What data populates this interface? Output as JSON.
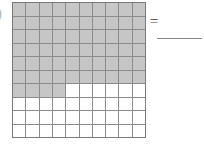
{
  "worksheet": {
    "item_label": ")",
    "equals_sign": "=",
    "answer_value": "",
    "answer_placeholder": ""
  },
  "colors": {
    "shaded_cell": "#c6c6c6",
    "unshaded_cell": "#ffffff",
    "grid_line": "#8c8c8c",
    "grid_frame": "#7a7a7a",
    "answer_line": "#888888",
    "text": "#3d3d3d"
  },
  "chart_data": {
    "type": "heatmap",
    "title": "",
    "subtitle": "",
    "xlabel": "",
    "ylabel": "",
    "rows": 10,
    "columns": 10,
    "total_cells": 100,
    "shaded_cells": 64,
    "unshaded_cells": 36,
    "fraction_shaded": "64/100",
    "decimal_shaded": 0.64,
    "percent_shaded": 64,
    "legend": [
      {
        "name": "shaded",
        "color": "#c6c6c6",
        "count": 64
      },
      {
        "name": "unshaded",
        "color": "#ffffff",
        "count": 36
      }
    ],
    "grid": [
      [
        1,
        1,
        1,
        1,
        1,
        1,
        1,
        1,
        1,
        1
      ],
      [
        1,
        1,
        1,
        1,
        1,
        1,
        1,
        1,
        1,
        1
      ],
      [
        1,
        1,
        1,
        1,
        1,
        1,
        1,
        1,
        1,
        1
      ],
      [
        1,
        1,
        1,
        1,
        1,
        1,
        1,
        1,
        1,
        1
      ],
      [
        1,
        1,
        1,
        1,
        1,
        1,
        1,
        1,
        1,
        1
      ],
      [
        1,
        1,
        1,
        1,
        1,
        1,
        1,
        1,
        1,
        1
      ],
      [
        1,
        1,
        1,
        1,
        0,
        0,
        0,
        0,
        0,
        0
      ],
      [
        0,
        0,
        0,
        0,
        0,
        0,
        0,
        0,
        0,
        0
      ],
      [
        0,
        0,
        0,
        0,
        0,
        0,
        0,
        0,
        0,
        0
      ],
      [
        0,
        0,
        0,
        0,
        0,
        0,
        0,
        0,
        0,
        0
      ]
    ],
    "row_shaded_counts": [
      10,
      10,
      10,
      10,
      10,
      10,
      4,
      0,
      0,
      0
    ],
    "annotations": []
  }
}
